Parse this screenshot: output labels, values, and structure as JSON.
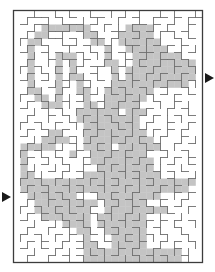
{
  "puzzle": {
    "type": "maze",
    "colors": {
      "background": "#ffffff",
      "shade": "#c4c4c4",
      "wall": "#6e6e6e",
      "border": "#3c3c3c",
      "arrow": "#1a1a1a"
    },
    "grid": {
      "cols": 27,
      "rows": 36,
      "origin_x": 13.5,
      "origin_y": 10.5,
      "cell": 7
    },
    "entrance": {
      "side": "left",
      "label": "start-arrow",
      "row": 26
    },
    "exit": {
      "side": "right",
      "label": "finish-arrow",
      "row": 9
    },
    "shade_rows": [
      "...........................",
      "...........................",
      "....#######.....####.......",
      "...##.....##...#####.......",
      "..##.......##..######......",
      "..#..........#..######.....",
      "..#...###....#...#######...",
      "..#...#.#....##..#########.",
      "..#...#.#.....#.##########.",
      "..#...#.##....#.##########.",
      "..#...#..#....###########..",
      "..##..#..##..#######.......",
      "...##.#...#..######........",
      "....###...##.#####.........",
      ".........######.###........",
      ".........#########.........",
      "..........########.........",
      ".....##...#########........",
      "....####..##########.......",
      ".#####....####.######......",
      ".#......#..########........",
      ".#.........#########.......",
      ".#..........########.......",
      ".##.......###########......",
      ".#########################.",
      ".########################..",
      "..#######...#########......",
      "...#########.######.......",
      "...########..#########.....",
      "....#######.#######.......",
      ".......####.#######.......",
      ".........##..######.......",
      "..........#...#####........",
      "..........##..#####........",
      "..........##############...",
      "..........##############..."
    ],
    "walls_h": [
      "..###.#.#..##..#.#..##.#.##",
      ".#.##..###.#.#...##.#.#..#.",
      "..#..###.#.#..##.#.#.##.#..",
      ".#.#.##.#..##.#..#.#...#.#.",
      "..#.#..##.#..#..##..#.#.#..",
      ".#..#.#..#.#.#.#..##.#.#.#.",
      "..#..#.##.#..#..#.#..##.#..",
      ".#.#..#..#.##..#..#.#..#.#.",
      "..#.#.#.#..#..#.#..#.#..#..",
      ".#..#..#.##.#..#.#..#.##.#.",
      "..#..#.#..#..#.#..#..#..#..",
      ".#.#..#..#.#..#.#..#.#.#.#.",
      "..#.#..#.#..#..#.#..#..#...",
      ".#..#.#..#.##.#..#.#..#.#..",
      "..#..#.#..#..#.#..#.#..#.#.",
      ".#.#..#.#..#..#.#..#..#..#.",
      "..#.#..#..#.#..#..#.#.#.#..",
      ".#..#.#.#..#..#.#.#..#..#..",
      "..#..#..#.#.#..#..#.#..#.#.",
      ".#.#..#..#..#.#.#..#.#..#..",
      "..#.#.#.#.#..#..#.#..#.#.#.",
      ".#..#..#..#.#.#..#.#..#..#.",
      "..#..#.#.#..#..#.#..#.#.#..",
      ".#.#..#..#.#..#..#.#..#..#.",
      "..#.#..#.#..#.#.#..#.#.#...",
      ".#..#.#..#.#..#..#..#..#.#.",
      "..#..#.#.#..#.#.#.#..#..#..",
      ".#.#..#..#.#..#..#.#.#.#.#.",
      "..#.#.#.#..#.#..#..#..#....",
      ".#..#..#.#..#..#.#.#.#.#.#.",
      "..#..#.#..#.#.#..#..#..#...",
      ".#.#..#.#..#..#.#..#.#..#..",
      "..#.#..#.#.#.#..#.#..#.#.#.",
      ".#..#.#..#..#..#.#..#..#...",
      "..#..#.#.#.#..#..#.#.#..#.."
    ],
    "walls_v": [
      "..#..#.#..#..#.#.#..#.#..#",
      ".#..#.#..#.#..#..#.#..#.#.",
      "..#.#..#.#..#.#.#..#.#..#.",
      ".#..#.#..#.#..#..#..#.#.#.",
      "#..#..#.#..#.#.#..#.#..#..",
      ".#..#..#..#..#..#.#..#.#.#",
      "..#.#.#..#.#.#.#..#.#..#..",
      ".#..#..#.#..#..#.#..#.#.#.",
      "#..#.#..#..#.#..#..#..#..#",
      ".#..#..#.#.#..#.#.#.#..#..",
      "..#..#.#..#..#..#..#.#.#.#",
      ".#.#..#..#.#.#.#..#..#..#.",
      "#..#.#.#.#..#..#.#.#..#...",
      ".#..#..#..#.#.#..#..#.#.#.",
      "..#.#.#.#..#..#.#.#..#..#.",
      ".#..#..#.#.#.#..#..#.#.#..",
      "#..#.#..#..#..#.#.#..#..#.",
      ".#..#.#..#.#.#..#..#.#.#..",
      "..#..#..#.#..#.#.#..#..#.#",
      ".#.#..#.#..#.#..#.#.#.#...",
      "#..#.#..#.#..#.#..#..#..#.",
      ".#..#.#..#..#..#.#..#.#.#.",
      "..#..#.#.#.#.#.#..#.#..#..",
      ".#.#..#..#..#..#.#..#.#..#",
      "#..#.#.#..#.#.#..#.#..#.#.",
      ".#..#..#.#..#..#.#..#.#...",
      "..#.#.#..#.#.#..#..#..#.#.",
      ".#..#..#.#..#.#.#.#.#..#..",
      "#..#.#.#..#..#..#..#.#..#.",
      ".#.#..#..#.#.#.#.#..#..#..",
      "..#..#.#.#..#..#..#.#.#..#",
      ".#..#..#..#.#.#..#..#..#..",
      "#..#.#.#.#..#..#.#.#.#..#.",
      ".#.#..#..#.#..#..#..#.#..#",
      "..#..#.#..#.#.#.#..#..#.#.",
      ".#..#..#.#..#..#.#.#.#..#."
    ]
  }
}
